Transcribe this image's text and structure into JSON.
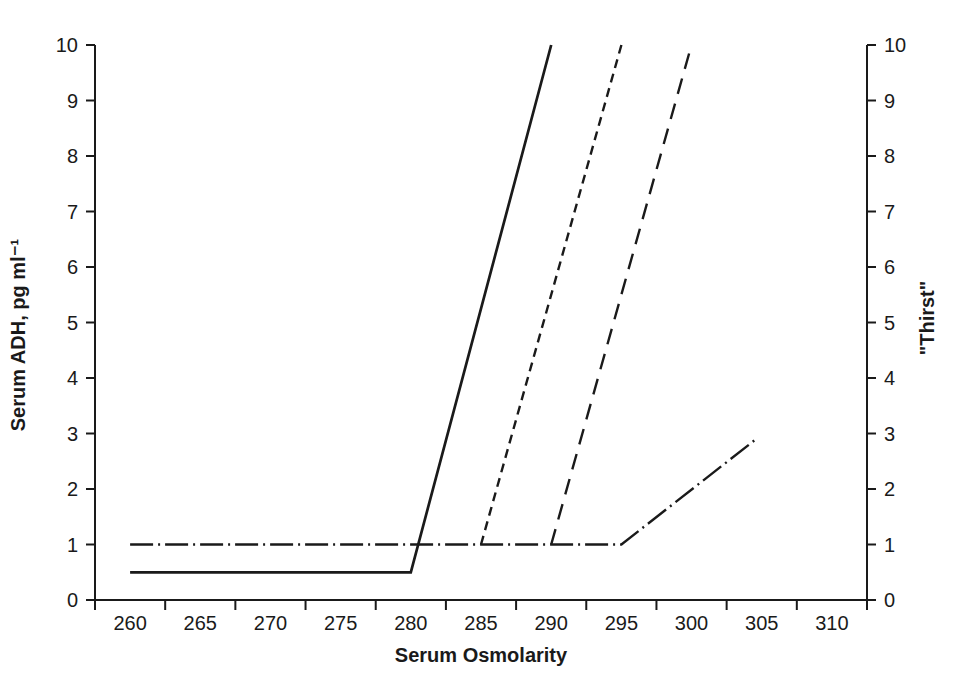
{
  "figure": {
    "background": "#ffffff",
    "line_color": "#1a1a1a"
  },
  "chart_data": {
    "type": "line",
    "title": "",
    "xlabel": "Serum Osmolarity",
    "ylabel_left": "Serum ADH, pg ml⁻¹",
    "ylabel_right": "\"Thirst\"",
    "xlim": [
      257.5,
      312.5
    ],
    "ylim": [
      0,
      10
    ],
    "ylim_right": [
      0,
      10
    ],
    "x_tick_labels": [
      260,
      265,
      270,
      275,
      280,
      285,
      290,
      295,
      300,
      305,
      310
    ],
    "x_tick_boundaries": [
      257.5,
      262.5,
      267.5,
      272.5,
      277.5,
      282.5,
      287.5,
      292.5,
      297.5,
      302.5,
      307.5,
      312.5
    ],
    "y_ticks_left": [
      0,
      1,
      2,
      3,
      4,
      5,
      6,
      7,
      8,
      9,
      10
    ],
    "y_ticks_right": [
      0,
      1,
      2,
      3,
      4,
      5,
      6,
      7,
      8,
      9,
      10
    ],
    "grid": false,
    "legend": "none",
    "series": [
      {
        "name": "adh-curve-solid",
        "style": "solid",
        "axis": "left",
        "points": [
          [
            260,
            0.5
          ],
          [
            280,
            0.5
          ],
          [
            290,
            10
          ]
        ]
      },
      {
        "name": "adh-curve-short-dash",
        "style": "short-dash",
        "axis": "left",
        "points": [
          [
            285,
            1
          ],
          [
            295,
            10
          ]
        ]
      },
      {
        "name": "adh-curve-long-dash",
        "style": "long-dash",
        "axis": "left",
        "points": [
          [
            290,
            1
          ],
          [
            300,
            10
          ]
        ]
      },
      {
        "name": "thirst-curve-dash-dot",
        "style": "dash-dot",
        "axis": "right",
        "points": [
          [
            260,
            1
          ],
          [
            295,
            1
          ],
          [
            304.6,
            2.9
          ]
        ]
      }
    ],
    "dash_styles": {
      "solid": "",
      "short-dash": "9 6",
      "long-dash": "16 10",
      "dash-dot": "23 5 2 5"
    }
  }
}
